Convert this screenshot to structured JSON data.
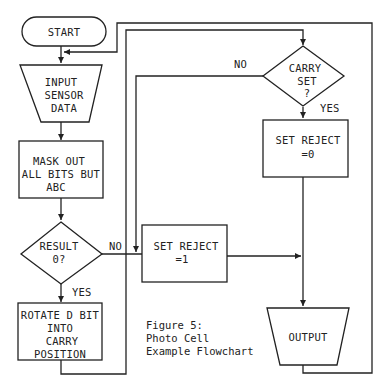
{
  "figure": {
    "caption": [
      "Figure 5:",
      "Photo Cell",
      "Example Flowchart"
    ]
  },
  "nodes": {
    "start": {
      "type": "terminator",
      "lines": [
        "START"
      ]
    },
    "input": {
      "type": "manual-input-trapezoid",
      "lines": [
        "INPUT",
        "SENSOR",
        "DATA"
      ]
    },
    "mask": {
      "type": "process",
      "lines": [
        "MASK OUT",
        "ALL BITS BUT",
        "ABC"
      ]
    },
    "result": {
      "type": "decision",
      "lines": [
        "RESULT",
        "0?"
      ]
    },
    "rotate": {
      "type": "process",
      "lines": [
        "ROTATE D BIT",
        "INTO",
        "CARRY",
        "POSITION"
      ]
    },
    "carry": {
      "type": "decision",
      "lines": [
        "CARRY",
        "SET",
        "?"
      ]
    },
    "reject0": {
      "type": "process",
      "lines": [
        "SET REJECT",
        "=0"
      ]
    },
    "reject1": {
      "type": "process",
      "lines": [
        "SET REJECT",
        "=1"
      ]
    },
    "output": {
      "type": "output-trapezoid",
      "lines": [
        "OUTPUT"
      ]
    }
  },
  "edges": {
    "result_no": "NO",
    "result_yes": "YES",
    "carry_no": "NO",
    "carry_yes": "YES"
  },
  "colors": {
    "ink": "#222222",
    "paper": "#ffffff"
  }
}
